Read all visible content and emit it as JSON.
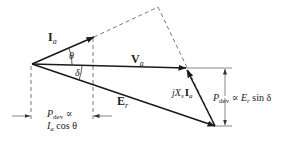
{
  "diagram": {
    "type": "phasor-diagram",
    "colors": {
      "line": "#1a1a1a",
      "dashed": "#555555",
      "text": "#222222",
      "background": "#ffffff"
    },
    "phasors": {
      "current": {
        "symbol": "I",
        "subscript": "a"
      },
      "voltage": {
        "symbol": "V",
        "subscript": "a"
      },
      "emf": {
        "symbol": "E",
        "subscript": "r"
      },
      "reactance_drop": {
        "prefix": "jX",
        "x_sub": "s",
        "symbol": "I",
        "subscript": "a"
      }
    },
    "angles": {
      "theta": "θ",
      "delta": "δ"
    },
    "annotations": {
      "left_line1_P": "P",
      "left_line1_sub": "dev",
      "left_line1_rest": " ∝",
      "left_line2_I": "I",
      "left_line2_sub": "a",
      "left_line2_rest": " cos θ",
      "right_P": "P",
      "right_sub": "dev",
      "right_rest_1": " ∝ ",
      "right_E": "E",
      "right_E_sub": "r",
      "right_rest_2": " sin δ"
    }
  }
}
